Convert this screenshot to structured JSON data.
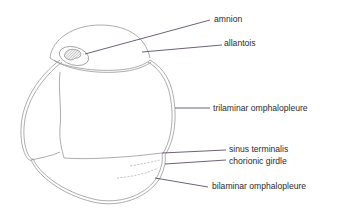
{
  "diagram": {
    "colors": {
      "outline": "#8a8a8a",
      "leader": "#4a3a55",
      "text": "#2b2b2b",
      "hatch": "#777777"
    },
    "labels": [
      {
        "id": "amnion",
        "text": "amnion"
      },
      {
        "id": "allantois",
        "text": "allantois"
      },
      {
        "id": "trilaminar-omphalopleure",
        "text": "trilaminar omphalopleure"
      },
      {
        "id": "sinus-terminalis",
        "text": "sinus terminalis"
      },
      {
        "id": "chorionic-girdle",
        "text": "chorionic girdle"
      },
      {
        "id": "bilaminar-omphalopleure",
        "text": "bilaminar omphalopleure"
      }
    ]
  }
}
